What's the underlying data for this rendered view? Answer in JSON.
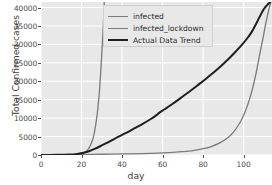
{
  "chart_data": {
    "type": "line",
    "title": "",
    "xlabel": "day",
    "ylabel": "Total Confirmed cases",
    "xlim": [
      0,
      114
    ],
    "ylim": [
      0,
      41500
    ],
    "xticks": [
      0,
      20,
      40,
      60,
      80,
      100
    ],
    "yticks": [
      0,
      5000,
      10000,
      15000,
      20000,
      25000,
      30000,
      35000,
      40000
    ],
    "grid": true,
    "grid_color": "#ffffff",
    "plot_bg": "#e8e8e8",
    "legend_position": "upper center",
    "series": [
      {
        "name": "infected",
        "color": "#7a7a7a",
        "width": 1.3,
        "x": [
          0,
          5,
          10,
          14,
          17,
          19,
          21,
          22,
          23,
          24,
          25,
          26,
          27,
          27.6,
          28.2,
          28.8,
          29.3,
          29.8,
          30.2,
          30.6,
          30.9,
          31.2
        ],
        "y": [
          10,
          20,
          45,
          95,
          180,
          300,
          600,
          900,
          1400,
          2200,
          3400,
          5200,
          8200,
          10500,
          13500,
          17000,
          21000,
          25500,
          29500,
          33500,
          37000,
          41500
        ]
      },
      {
        "name": "infected_lockdown",
        "color": "#7a7a7a",
        "width": 1.3,
        "x": [
          0,
          10,
          20,
          30,
          40,
          50,
          55,
          60,
          65,
          70,
          75,
          80,
          84,
          88,
          92,
          95,
          98,
          100,
          102,
          104,
          106,
          108,
          109.5,
          110.5,
          111.5,
          112.5,
          113.5
        ],
        "y": [
          10,
          40,
          120,
          200,
          280,
          380,
          450,
          560,
          700,
          900,
          1200,
          1700,
          2300,
          3200,
          4600,
          6200,
          8600,
          10800,
          13600,
          17200,
          21800,
          27500,
          31500,
          34500,
          37200,
          39600,
          41500
        ]
      },
      {
        "name": "Actual Data Trend",
        "color": "#1f1f1f",
        "width": 2.0,
        "x": [
          0,
          8,
          14,
          18,
          21,
          24,
          27,
          30,
          34,
          38,
          42,
          46,
          50,
          54,
          57,
          58,
          61,
          65,
          69,
          73,
          77,
          81,
          85,
          89,
          93,
          96,
          99,
          102,
          104,
          106,
          108,
          110,
          111.5,
          113
        ],
        "y": [
          10,
          40,
          120,
          300,
          600,
          1100,
          1800,
          2600,
          3700,
          4900,
          6000,
          7200,
          8400,
          9700,
          10800,
          11300,
          12400,
          13900,
          15500,
          17100,
          18800,
          20500,
          22300,
          24200,
          26300,
          28000,
          29800,
          31800,
          33400,
          35400,
          37600,
          39600,
          40600,
          41500
        ]
      }
    ]
  },
  "legend": {
    "items": [
      {
        "label": "infected"
      },
      {
        "label": "infected_lockdown"
      },
      {
        "label": "Actual Data Trend"
      }
    ]
  },
  "axes": {
    "x_label": "day",
    "y_label": "Total Confirmed cases",
    "x_tick_labels": [
      "0",
      "20",
      "40",
      "60",
      "80",
      "100"
    ],
    "y_tick_labels": [
      "0",
      "5000",
      "10000",
      "15000",
      "20000",
      "25000",
      "30000",
      "35000",
      "40000"
    ]
  }
}
